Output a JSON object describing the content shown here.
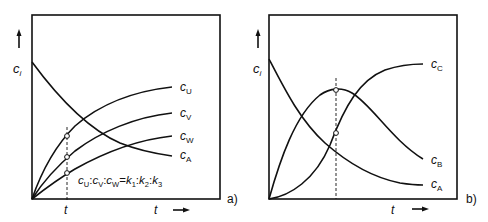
{
  "panels": [
    {
      "id": "a",
      "tag": "a)",
      "y_axis_label": "c",
      "y_axis_sub": "i",
      "x_axis_label": "t",
      "marker_time_label": "t",
      "formula": {
        "text": "cU : cV : cW = k1 : k2 : k3",
        "parts": [
          {
            "base": "c",
            "sub": "U"
          },
          {
            "sep": ":"
          },
          {
            "base": "c",
            "sub": "V"
          },
          {
            "sep": ":"
          },
          {
            "base": "c",
            "sub": "W"
          },
          {
            "sep": "="
          },
          {
            "base": "k",
            "sub": "1"
          },
          {
            "sep": ":"
          },
          {
            "base": "k",
            "sub": "2"
          },
          {
            "sep": ":"
          },
          {
            "base": "k",
            "sub": "3"
          }
        ]
      },
      "curves": [
        {
          "name": "cU",
          "base": "c",
          "sub": "U",
          "shape": "rising-saturating"
        },
        {
          "name": "cV",
          "base": "c",
          "sub": "V",
          "shape": "rising-saturating"
        },
        {
          "name": "cW",
          "base": "c",
          "sub": "W",
          "shape": "rising-saturating"
        },
        {
          "name": "cA",
          "base": "c",
          "sub": "A",
          "shape": "exponential-decay"
        }
      ]
    },
    {
      "id": "b",
      "tag": "b)",
      "y_axis_label": "c",
      "y_axis_sub": "i",
      "x_axis_label": "t",
      "curves": [
        {
          "name": "cC",
          "base": "c",
          "sub": "C",
          "shape": "sigmoidal-rise"
        },
        {
          "name": "cB",
          "base": "c",
          "sub": "B",
          "shape": "rise-and-fall"
        },
        {
          "name": "cA",
          "base": "c",
          "sub": "A",
          "shape": "exponential-decay"
        }
      ]
    }
  ],
  "colors": {
    "line": "#111111",
    "background": "#ffffff"
  }
}
